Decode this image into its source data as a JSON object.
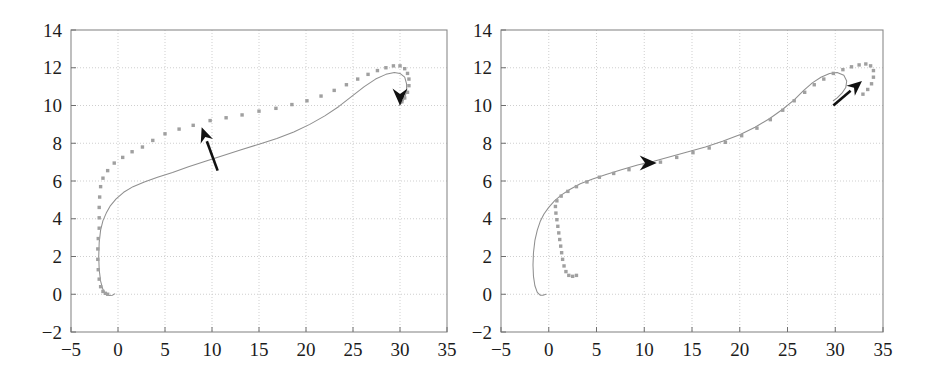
{
  "figure": {
    "background": "#ffffff",
    "width": 930,
    "height": 385,
    "panel_count": 2
  },
  "style": {
    "grid_color": "#c9c9c9",
    "frame_color": "#8a8a8a",
    "curve_color": "#8f8f8f",
    "dot_color": "#a0a0a0",
    "arrow_color": "#111111",
    "tick_color": "#1c1c1c"
  },
  "chart_data": [
    {
      "type": "scatter",
      "panel_name": "left-plot",
      "title": "",
      "xlabel": "",
      "ylabel": "",
      "xlim": [
        -5,
        35
      ],
      "ylim": [
        -2,
        14
      ],
      "xticks": [
        -5,
        0,
        5,
        10,
        15,
        20,
        25,
        30,
        35
      ],
      "yticks": [
        -2,
        0,
        2,
        4,
        6,
        8,
        10,
        12,
        14
      ],
      "xtick_labels": [
        "-5",
        "0",
        "5",
        "10",
        "15",
        "20",
        "25",
        "30",
        "35"
      ],
      "ytick_labels": [
        "-2",
        "0",
        "2",
        "4",
        "6",
        "8",
        "10",
        "12",
        "14"
      ],
      "grid": true,
      "grid_style": "dotted",
      "legend": null,
      "series": [
        {
          "name": "reference-trajectory",
          "render": "line",
          "color": "#8f8f8f",
          "points": [
            [
              -0.35,
              0.02
            ],
            [
              -0.6,
              -0.05
            ],
            [
              -0.95,
              -0.07
            ],
            [
              -1.3,
              0.0
            ],
            [
              -1.6,
              0.25
            ],
            [
              -1.85,
              0.7
            ],
            [
              -2.0,
              1.3
            ],
            [
              -2.05,
              2.0
            ],
            [
              -2.0,
              2.75
            ],
            [
              -1.85,
              3.4
            ],
            [
              -1.6,
              3.9
            ],
            [
              -1.25,
              4.3
            ],
            [
              -0.8,
              4.7
            ],
            [
              -0.2,
              5.05
            ],
            [
              0.6,
              5.4
            ],
            [
              1.6,
              5.7
            ],
            [
              2.8,
              5.95
            ],
            [
              4.2,
              6.2
            ],
            [
              5.8,
              6.45
            ],
            [
              7.5,
              6.75
            ],
            [
              9.3,
              7.05
            ],
            [
              11.2,
              7.35
            ],
            [
              13.1,
              7.65
            ],
            [
              15.0,
              7.95
            ],
            [
              16.9,
              8.25
            ],
            [
              18.7,
              8.6
            ],
            [
              20.4,
              9.0
            ],
            [
              22.0,
              9.45
            ],
            [
              23.5,
              9.95
            ],
            [
              24.9,
              10.5
            ],
            [
              26.2,
              11.0
            ],
            [
              27.4,
              11.4
            ],
            [
              28.5,
              11.65
            ],
            [
              29.4,
              11.75
            ],
            [
              30.0,
              11.7
            ],
            [
              30.5,
              11.5
            ],
            [
              30.7,
              11.15
            ],
            [
              30.7,
              10.75
            ],
            [
              30.5,
              10.4
            ],
            [
              30.2,
              10.15
            ],
            [
              29.9,
              10.0
            ]
          ]
        },
        {
          "name": "measured-points",
          "render": "dots",
          "color": "#a0a0a0",
          "points": [
            [
              -1.1,
              0.0
            ],
            [
              -1.35,
              0.05
            ],
            [
              -1.6,
              0.15
            ],
            [
              -1.85,
              0.4
            ],
            [
              -2.0,
              0.8
            ],
            [
              -2.1,
              1.3
            ],
            [
              -2.15,
              1.85
            ],
            [
              -2.15,
              2.4
            ],
            [
              -2.1,
              2.95
            ],
            [
              -2.0,
              3.5
            ],
            [
              -2.0,
              4.05
            ],
            [
              -2.0,
              4.6
            ],
            [
              -1.95,
              5.15
            ],
            [
              -1.85,
              5.7
            ],
            [
              -1.6,
              6.15
            ],
            [
              -1.1,
              6.55
            ],
            [
              -0.4,
              6.95
            ],
            [
              0.5,
              7.25
            ],
            [
              1.5,
              7.55
            ],
            [
              2.6,
              7.8
            ],
            [
              3.7,
              8.15
            ],
            [
              5.0,
              8.5
            ],
            [
              6.5,
              8.75
            ],
            [
              8.0,
              8.95
            ],
            [
              9.8,
              9.2
            ],
            [
              11.5,
              9.35
            ],
            [
              13.2,
              9.5
            ],
            [
              15.0,
              9.7
            ],
            [
              16.8,
              9.85
            ],
            [
              18.5,
              10.05
            ],
            [
              20.1,
              10.25
            ],
            [
              21.6,
              10.5
            ],
            [
              23.0,
              10.8
            ],
            [
              24.3,
              11.1
            ],
            [
              25.5,
              11.4
            ],
            [
              26.6,
              11.65
            ],
            [
              27.6,
              11.85
            ],
            [
              28.5,
              12.0
            ],
            [
              29.3,
              12.1
            ],
            [
              30.0,
              12.1
            ],
            [
              30.5,
              11.95
            ],
            [
              30.8,
              11.7
            ],
            [
              30.95,
              11.4
            ],
            [
              30.95,
              11.05
            ],
            [
              30.8,
              10.7
            ],
            [
              30.5,
              10.4
            ],
            [
              30.2,
              10.2
            ]
          ]
        }
      ],
      "annotations": [
        {
          "name": "direction-arrow-lower",
          "kind": "arrow",
          "from": [
            10.6,
            6.55
          ],
          "to": [
            8.9,
            8.85
          ],
          "head": "up-left"
        },
        {
          "name": "direction-arrowhead-upper",
          "kind": "arrowhead",
          "at": [
            30.0,
            10.0
          ],
          "head": "down"
        }
      ]
    },
    {
      "type": "scatter",
      "panel_name": "right-plot",
      "title": "",
      "xlabel": "",
      "ylabel": "",
      "xlim": [
        -5,
        35
      ],
      "ylim": [
        -2,
        14
      ],
      "xticks": [
        -5,
        0,
        5,
        10,
        15,
        20,
        25,
        30,
        35
      ],
      "yticks": [
        -2,
        0,
        2,
        4,
        6,
        8,
        10,
        12,
        14
      ],
      "xtick_labels": [
        "-5",
        "0",
        "5",
        "10",
        "15",
        "20",
        "25",
        "30",
        "35"
      ],
      "ytick_labels": [
        "-2",
        "0",
        "2",
        "4",
        "6",
        "8",
        "10",
        "12",
        "14"
      ],
      "grid": true,
      "grid_style": "dotted",
      "legend": null,
      "series": [
        {
          "name": "reference-trajectory",
          "render": "line",
          "color": "#8f8f8f",
          "points": [
            [
              -0.3,
              0.0
            ],
            [
              -0.6,
              -0.05
            ],
            [
              -0.9,
              -0.05
            ],
            [
              -1.2,
              0.1
            ],
            [
              -1.45,
              0.45
            ],
            [
              -1.6,
              0.95
            ],
            [
              -1.65,
              1.55
            ],
            [
              -1.6,
              2.2
            ],
            [
              -1.45,
              2.85
            ],
            [
              -1.2,
              3.4
            ],
            [
              -0.9,
              3.85
            ],
            [
              -0.5,
              4.25
            ],
            [
              0.0,
              4.6
            ],
            [
              0.6,
              4.95
            ],
            [
              1.3,
              5.25
            ],
            [
              2.2,
              5.55
            ],
            [
              3.3,
              5.85
            ],
            [
              4.6,
              6.1
            ],
            [
              6.0,
              6.35
            ],
            [
              7.6,
              6.6
            ],
            [
              9.3,
              6.85
            ],
            [
              11.0,
              7.05
            ],
            [
              12.8,
              7.3
            ],
            [
              14.6,
              7.55
            ],
            [
              16.4,
              7.8
            ],
            [
              18.2,
              8.1
            ],
            [
              20.0,
              8.45
            ],
            [
              21.6,
              8.85
            ],
            [
              23.1,
              9.3
            ],
            [
              24.5,
              9.8
            ],
            [
              25.7,
              10.3
            ],
            [
              26.7,
              10.8
            ],
            [
              27.6,
              11.2
            ],
            [
              28.5,
              11.5
            ],
            [
              29.4,
              11.7
            ],
            [
              30.2,
              11.75
            ],
            [
              30.9,
              11.6
            ],
            [
              31.2,
              11.3
            ],
            [
              31.1,
              10.95
            ],
            [
              30.7,
              10.65
            ],
            [
              30.2,
              10.4
            ],
            [
              29.8,
              10.25
            ]
          ]
        },
        {
          "name": "measured-points",
          "render": "dots",
          "color": "#a0a0a0",
          "points": [
            [
              2.9,
              1.0
            ],
            [
              2.5,
              0.95
            ],
            [
              2.1,
              1.0
            ],
            [
              1.8,
              1.2
            ],
            [
              1.6,
              1.5
            ],
            [
              1.45,
              1.85
            ],
            [
              1.35,
              2.2
            ],
            [
              1.25,
              2.55
            ],
            [
              1.15,
              2.9
            ],
            [
              1.05,
              3.25
            ],
            [
              0.95,
              3.6
            ],
            [
              0.85,
              3.95
            ],
            [
              0.75,
              4.3
            ],
            [
              0.7,
              4.65
            ],
            [
              0.85,
              4.95
            ],
            [
              1.3,
              5.2
            ],
            [
              2.0,
              5.45
            ],
            [
              2.9,
              5.7
            ],
            [
              4.0,
              5.95
            ],
            [
              5.3,
              6.2
            ],
            [
              6.8,
              6.4
            ],
            [
              8.4,
              6.6
            ],
            [
              10.0,
              6.8
            ],
            [
              11.7,
              7.0
            ],
            [
              13.4,
              7.25
            ],
            [
              15.1,
              7.5
            ],
            [
              16.8,
              7.75
            ],
            [
              18.5,
              8.05
            ],
            [
              20.2,
              8.4
            ],
            [
              21.8,
              8.8
            ],
            [
              23.2,
              9.25
            ],
            [
              24.5,
              9.75
            ],
            [
              25.7,
              10.25
            ],
            [
              26.8,
              10.7
            ],
            [
              27.8,
              11.1
            ],
            [
              28.8,
              11.4
            ],
            [
              29.8,
              11.7
            ],
            [
              30.8,
              11.9
            ],
            [
              31.7,
              12.05
            ],
            [
              32.5,
              12.15
            ],
            [
              33.2,
              12.2
            ],
            [
              33.7,
              12.1
            ],
            [
              34.0,
              11.85
            ],
            [
              34.0,
              11.5
            ],
            [
              33.8,
              11.15
            ],
            [
              33.4,
              10.85
            ],
            [
              32.9,
              10.6
            ]
          ]
        }
      ],
      "annotations": [
        {
          "name": "direction-arrowhead-middle",
          "kind": "arrowhead",
          "at": [
            11.3,
            6.95
          ],
          "head": "right"
        },
        {
          "name": "direction-arrow-upper",
          "kind": "arrow",
          "from": [
            29.8,
            10.0
          ],
          "to": [
            32.8,
            11.3
          ],
          "head": "up-right"
        }
      ]
    }
  ]
}
